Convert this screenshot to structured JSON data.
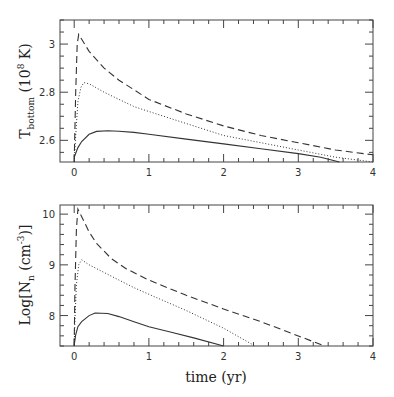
{
  "chart_data": [
    {
      "type": "line",
      "panel": "top",
      "title": "",
      "xlabel": "",
      "ylabel": "T_bottom (10^8 K)",
      "ylabel_parts": {
        "main": "T",
        "sub": "bottom",
        "unit_open": " (10",
        "sup": "8",
        "unit_close": " K)"
      },
      "xlim": [
        -0.19,
        4.0
      ],
      "ylim": [
        2.51,
        3.1
      ],
      "xticks": [
        0,
        1,
        2,
        3,
        4
      ],
      "xtick_labels": [
        "0",
        "1",
        "2",
        "3",
        "4"
      ],
      "yticks": [
        2.6,
        2.8,
        3.0
      ],
      "ytick_labels": [
        "2.6",
        "2.8",
        "3"
      ],
      "grid": false,
      "legend": null,
      "series": [
        {
          "name": "dashed",
          "style": "dashed",
          "x": [
            0.0,
            0.02,
            0.04,
            0.06,
            0.1,
            0.2,
            0.4,
            0.6,
            0.8,
            1.0,
            1.5,
            2.0,
            2.5,
            3.0,
            3.5,
            4.0
          ],
          "y": [
            2.51,
            2.8,
            3.0,
            3.04,
            3.02,
            2.97,
            2.9,
            2.85,
            2.81,
            2.77,
            2.71,
            2.66,
            2.62,
            2.59,
            2.56,
            2.54
          ]
        },
        {
          "name": "dotted",
          "style": "dotted",
          "x": [
            0.0,
            0.02,
            0.05,
            0.09,
            0.13,
            0.2,
            0.4,
            0.6,
            0.8,
            1.0,
            1.5,
            2.0,
            2.5,
            3.0,
            3.5,
            4.0
          ],
          "y": [
            2.51,
            2.62,
            2.76,
            2.82,
            2.84,
            2.835,
            2.8,
            2.77,
            2.74,
            2.72,
            2.67,
            2.62,
            2.59,
            2.56,
            2.53,
            2.51
          ]
        },
        {
          "name": "solid",
          "style": "solid",
          "x": [
            0.0,
            0.05,
            0.1,
            0.2,
            0.3,
            0.45,
            0.6,
            0.8,
            1.0,
            1.5,
            2.0,
            2.5,
            3.0,
            3.3,
            3.55
          ],
          "y": [
            2.53,
            2.57,
            2.595,
            2.625,
            2.637,
            2.64,
            2.638,
            2.633,
            2.625,
            2.605,
            2.585,
            2.565,
            2.545,
            2.53,
            2.51
          ]
        }
      ]
    },
    {
      "type": "line",
      "panel": "bottom",
      "title": "",
      "xlabel": "time (yr)",
      "ylabel": "Log[N_n (cm^-3)]",
      "ylabel_parts": {
        "main": "Log[N",
        "sub": "n",
        "unit_open": " (cm",
        "sup": "-3",
        "unit_close": ")]"
      },
      "xlim": [
        -0.19,
        4.0
      ],
      "ylim": [
        7.4,
        10.18
      ],
      "xticks": [
        0,
        1,
        2,
        3,
        4
      ],
      "xtick_labels": [
        "0",
        "1",
        "2",
        "3",
        "4"
      ],
      "yticks": [
        8,
        9,
        10
      ],
      "ytick_labels": [
        "8",
        "9",
        "10"
      ],
      "grid": false,
      "legend": null,
      "series": [
        {
          "name": "dashed",
          "style": "dashed",
          "x": [
            0.0,
            0.01,
            0.03,
            0.05,
            0.1,
            0.2,
            0.3,
            0.5,
            0.7,
            1.0,
            1.5,
            2.0,
            2.5,
            3.0,
            3.35
          ],
          "y": [
            7.4,
            8.5,
            9.7,
            10.1,
            9.95,
            9.65,
            9.42,
            9.12,
            8.92,
            8.7,
            8.4,
            8.13,
            7.88,
            7.6,
            7.4
          ]
        },
        {
          "name": "dotted",
          "style": "dotted",
          "x": [
            0.0,
            0.01,
            0.03,
            0.06,
            0.1,
            0.2,
            0.4,
            0.6,
            0.8,
            1.0,
            1.5,
            2.0,
            2.42
          ],
          "y": [
            7.4,
            7.9,
            8.6,
            9.0,
            9.1,
            9.0,
            8.85,
            8.7,
            8.55,
            8.42,
            8.1,
            7.75,
            7.4
          ]
        },
        {
          "name": "solid",
          "style": "solid",
          "x": [
            0.0,
            0.02,
            0.05,
            0.1,
            0.2,
            0.28,
            0.45,
            0.6,
            0.8,
            1.0,
            1.3,
            1.6,
            2.0
          ],
          "y": [
            7.42,
            7.62,
            7.78,
            7.88,
            8.0,
            8.05,
            8.04,
            7.98,
            7.88,
            7.78,
            7.67,
            7.56,
            7.4
          ]
        }
      ]
    }
  ],
  "labels": {
    "top_ylabel": "T_bottom (10^8 K)",
    "bottom_ylabel": "Log[N_n (cm^-3)]",
    "xlabel": "time (yr)"
  },
  "colors": {
    "frame": "#444444",
    "line": "#333333",
    "background": "#ffffff"
  }
}
